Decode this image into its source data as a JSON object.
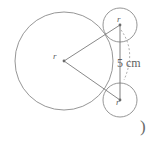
{
  "figure": {
    "labels": {
      "center_radius": "r",
      "top_circle_radius": "r",
      "bottom_circle_radius": "r",
      "distance": "5 cm",
      "trailing_paren": ")"
    },
    "colors": {
      "stroke": "#8a8a8a",
      "line": "#7a7a7a",
      "dashed": "#9a9a9a",
      "text": "#5f5f5f",
      "background": "#ffffff"
    },
    "geometry": {
      "large_circle": {
        "cx": 64,
        "cy": 61,
        "r": 49
      },
      "top_circle": {
        "cx": 120,
        "cy": 25,
        "r": 17
      },
      "bottom_circle": {
        "cx": 120,
        "cy": 100,
        "r": 17
      },
      "center_point": {
        "x": 64,
        "y": 61
      },
      "dimension_line": {
        "x": 120,
        "y1": 25,
        "y2": 100
      }
    }
  }
}
